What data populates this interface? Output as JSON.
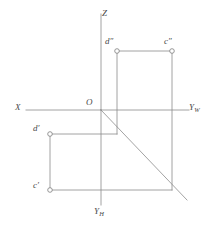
{
  "figure": {
    "type": "descriptive-geometry-projection-diagram",
    "background_color": "#ffffff",
    "line_color": "#8c8c8c",
    "text_color": "#4a4a4a",
    "width": 217,
    "height": 228
  },
  "axes": {
    "x_axis": {
      "label": "X",
      "label_x": 15,
      "label_y": 103
    },
    "z_axis": {
      "label": "Z",
      "label_x": 102,
      "label_y": 9
    },
    "yw_axis": {
      "label": "Y",
      "subscript": "W",
      "label_x": 189,
      "label_y": 103
    },
    "yh_axis": {
      "label": "Y",
      "subscript": "H",
      "label_x": 94,
      "label_y": 207
    },
    "origin": {
      "label": "O",
      "label_x": 86,
      "label_y": 98
    }
  },
  "points": [
    {
      "name": "d-double-prime",
      "label": "d",
      "prime": "″",
      "cx": 117,
      "cy": 51,
      "label_x": 105,
      "label_y": 37
    },
    {
      "name": "c-double-prime",
      "label": "c",
      "prime": "″",
      "cx": 172,
      "cy": 51,
      "label_x": 164,
      "label_y": 37
    },
    {
      "name": "d-prime",
      "label": "d",
      "prime": "′",
      "cx": 50,
      "cy": 134,
      "label_x": 33,
      "label_y": 124
    },
    {
      "name": "c-prime",
      "label": "c",
      "prime": "′",
      "cx": 50,
      "cy": 190,
      "label_x": 33,
      "label_y": 181
    }
  ],
  "geometry": {
    "x_axis_line": {
      "x1": 26,
      "y1": 110,
      "x2": 189,
      "y2": 110
    },
    "z_axis_line": {
      "x1": 101,
      "y1": 14,
      "x2": 101,
      "y2": 110
    },
    "yh_axis_line": {
      "x1": 101,
      "y1": 110,
      "x2": 101,
      "y2": 205
    },
    "yw_axis_line": {
      "x1": 101,
      "y1": 110,
      "x2": 187,
      "y2": 110
    },
    "bisector_line": {
      "x1": 101,
      "y1": 110,
      "x2": 187,
      "y2": 200
    },
    "segment_dd_cc_top": {
      "x1": 117,
      "y1": 51,
      "x2": 172,
      "y2": 51
    },
    "segment_d_vertical": {
      "x1": 117,
      "y1": 51,
      "x2": 117,
      "y2": 134
    },
    "segment_c_vertical": {
      "x1": 172,
      "y1": 51,
      "x2": 172,
      "y2": 190
    },
    "segment_dprime_horizontal": {
      "x1": 50,
      "y1": 134,
      "x2": 117,
      "y2": 134
    },
    "segment_cprime_horizontal": {
      "x1": 50,
      "y1": 190,
      "x2": 172,
      "y2": 190
    },
    "segment_left_vertical": {
      "x1": 50,
      "y1": 134,
      "x2": 50,
      "y2": 190
    }
  }
}
